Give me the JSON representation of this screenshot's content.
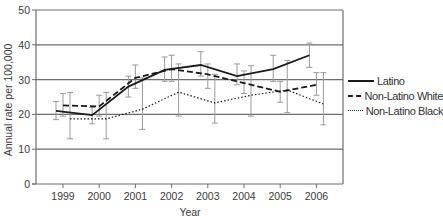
{
  "chart_data": {
    "type": "line",
    "title": "",
    "xlabel": "Year",
    "ylabel": "Annual rate per 100,000",
    "ylim": [
      0,
      50
    ],
    "yticks": [
      0,
      10,
      20,
      30,
      40,
      50
    ],
    "grid": "horizontal",
    "legend_position": "right",
    "categories": [
      "1999",
      "2000",
      "2001",
      "2002",
      "2003",
      "2004",
      "2005",
      "2006"
    ],
    "series": [
      {
        "name": "Latino",
        "style": "solid",
        "values": [
          21.0,
          19.8,
          28.0,
          32.8,
          34.2,
          31.0,
          33.0,
          37.0
        ],
        "error_low": [
          18.5,
          17.3,
          25.0,
          29.5,
          31.0,
          28.5,
          29.5,
          33.5
        ],
        "error_high": [
          23.7,
          22.0,
          31.0,
          36.5,
          38.0,
          34.5,
          37.0,
          40.5
        ]
      },
      {
        "name": "Non-Latino White",
        "style": "dashed",
        "values": [
          22.6,
          22.3,
          30.5,
          33.0,
          31.5,
          29.0,
          26.5,
          28.5
        ],
        "error_low": [
          19.5,
          19.5,
          27.5,
          29.5,
          27.5,
          26.0,
          23.5,
          25.5
        ],
        "error_high": [
          26.0,
          25.5,
          34.2,
          37.0,
          34.5,
          32.5,
          29.5,
          32.0
        ]
      },
      {
        "name": "Non-Latino Black",
        "style": "dotted",
        "values": [
          18.7,
          18.7,
          21.5,
          26.4,
          23.3,
          25.5,
          27.0,
          23.0
        ],
        "error_low": [
          13.0,
          13.0,
          15.7,
          19.5,
          17.5,
          19.5,
          20.5,
          17.0
        ],
        "error_high": [
          26.3,
          26.3,
          30.5,
          34.5,
          31.5,
          34.0,
          35.5,
          32.0
        ]
      }
    ]
  },
  "colors": {
    "line": "#1a1a1a",
    "grid": "#6e6e6e",
    "axis": "#6e6e6e",
    "error_bar": "#9a9a9a",
    "text": "#3a3a3a"
  }
}
